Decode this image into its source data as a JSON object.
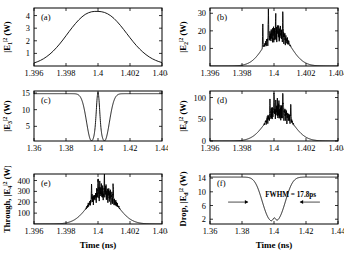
{
  "figure": {
    "xaxis_name": "Time (ns)",
    "panels": [
      "a",
      "b",
      "c",
      "d",
      "e",
      "f"
    ]
  },
  "chart_data": [
    {
      "type": "line",
      "panel": "a",
      "tag": "(a)",
      "title": "",
      "xlabel": "Time (ns)",
      "ylabel": "|E₁|² (W)",
      "ylabel_parts": {
        "pre": "|E",
        "sub": "1",
        "sup": "2",
        "post": " (W)"
      },
      "xlim": [
        1.396,
        1.404
      ],
      "ylim": [
        0,
        4.6
      ],
      "xticks": [
        1.396,
        1.398,
        1.4,
        1.402,
        1.404
      ],
      "xticklabels": [
        "1.396",
        "1.398",
        "1.4",
        "1.402",
        "1.404"
      ],
      "yticks": [
        1,
        2,
        3,
        4
      ],
      "yticklabels": [
        "1",
        "2",
        "3",
        "4"
      ],
      "grid": false,
      "legend": "none",
      "noise": 0,
      "shape": "gaussian-pulse",
      "x": [
        1.396,
        1.3962,
        1.3964,
        1.3966,
        1.3968,
        1.397,
        1.3972,
        1.3974,
        1.3976,
        1.3978,
        1.398,
        1.3982,
        1.3984,
        1.3986,
        1.3988,
        1.399,
        1.3992,
        1.3994,
        1.3996,
        1.3998,
        1.4,
        1.4002,
        1.4004,
        1.4006,
        1.4008,
        1.401,
        1.4012,
        1.4014,
        1.4016,
        1.4018,
        1.402,
        1.4022,
        1.4024,
        1.4026,
        1.4028,
        1.403,
        1.4032,
        1.4034,
        1.4036,
        1.4038,
        1.404
      ],
      "y": [
        0.24,
        0.33,
        0.44,
        0.58,
        0.75,
        0.95,
        1.18,
        1.45,
        1.74,
        2.06,
        2.4,
        2.74,
        3.07,
        3.38,
        3.66,
        3.9,
        4.09,
        4.22,
        4.3,
        4.33,
        4.33,
        4.31,
        4.25,
        4.14,
        3.98,
        3.77,
        3.51,
        3.22,
        2.9,
        2.57,
        2.24,
        1.92,
        1.62,
        1.35,
        1.11,
        0.9,
        0.72,
        0.57,
        0.45,
        0.35,
        0.27
      ]
    },
    {
      "type": "line",
      "panel": "b",
      "tag": "(b)",
      "title": "",
      "xlabel": "Time (ns)",
      "ylabel": "|E₂|² (W)",
      "ylabel_parts": {
        "pre": "|E",
        "sub": "2",
        "sup": "2",
        "post": " (W)"
      },
      "xlim": [
        1.396,
        1.404
      ],
      "ylim": [
        0,
        33
      ],
      "xticks": [
        1.396,
        1.398,
        1.4,
        1.402,
        1.404
      ],
      "xticklabels": [
        "1.396",
        "1.398",
        "1.4",
        "1.402",
        "1.404"
      ],
      "yticks": [
        10,
        20,
        30
      ],
      "yticklabels": [
        "10",
        "20",
        "30"
      ],
      "grid": false,
      "legend": "none",
      "shape": "chaotic-envelope",
      "envelope_peak": 19.0,
      "envelope_center": 1.4002,
      "envelope_width": 0.00115,
      "noise_amp": 4.0,
      "noise_onset": 0.55,
      "spikes": [
        {
          "x": 1.39965,
          "y": 31.5
        },
        {
          "x": 1.40055,
          "y": 30.5
        },
        {
          "x": 1.4001,
          "y": 25.0
        },
        {
          "x": 1.3993,
          "y": 24.0
        }
      ],
      "seed": 17
    },
    {
      "type": "line",
      "panel": "c",
      "tag": "(c)",
      "title": "",
      "xlabel": "Time (ns)",
      "ylabel": "|E₃|² (W)",
      "ylabel_parts": {
        "pre": "|E",
        "sub": "3",
        "sup": "2",
        "post": " (W)"
      },
      "xlim": [
        1.36,
        1.44
      ],
      "ylim": [
        0.6,
        15.6
      ],
      "xticks": [
        1.36,
        1.38,
        1.4,
        1.42,
        1.44
      ],
      "xticklabels": [
        "1.36",
        "1.38",
        "1.4",
        "1.42",
        "1.44"
      ],
      "yticks": [
        5,
        10,
        15
      ],
      "yticklabels": [
        "5",
        "10",
        "15"
      ],
      "grid": false,
      "legend": "none",
      "shape": "double-dip-with-central-spike",
      "baseline": 14.8,
      "dips": [
        {
          "center": 1.3958,
          "depth": 13.9,
          "width": 0.0042
        },
        {
          "center": 1.4042,
          "depth": 13.9,
          "width": 0.0042
        }
      ],
      "central_spike": {
        "center": 1.4,
        "height": 15.2,
        "width": 0.0013
      }
    },
    {
      "type": "line",
      "panel": "d",
      "tag": "(d)",
      "title": "",
      "xlabel": "Time (ns)",
      "ylabel": "|E₄|² (W)",
      "ylabel_parts": {
        "pre": "|E",
        "sub": "4",
        "sup": "2",
        "post": " (W)"
      },
      "xlim": [
        1.396,
        1.404
      ],
      "ylim": [
        0,
        115
      ],
      "xticks": [
        1.396,
        1.398,
        1.4,
        1.402,
        1.404
      ],
      "xticklabels": [
        "1.396",
        "1.398",
        "1.4",
        "1.402",
        "1.404"
      ],
      "yticks": [
        0,
        50,
        100
      ],
      "yticklabels": [
        "0",
        "50",
        "100"
      ],
      "grid": false,
      "legend": "none",
      "shape": "chaotic-envelope",
      "envelope_peak": 70.0,
      "envelope_center": 1.4003,
      "envelope_width": 0.00118,
      "noise_amp": 15.0,
      "noise_onset": 0.5,
      "spikes": [
        {
          "x": 1.4,
          "y": 112.0
        },
        {
          "x": 1.40055,
          "y": 97.0
        },
        {
          "x": 1.39975,
          "y": 92.0
        },
        {
          "x": 1.40105,
          "y": 88.0
        }
      ],
      "seed": 29
    },
    {
      "type": "line",
      "panel": "e",
      "tag": "(e)",
      "title": "",
      "xlabel": "Time (ns)",
      "ylabel": "Through, |E₄|² (W)",
      "ylabel_parts": {
        "pre": "Through, |E",
        "sub": "4",
        "sup": "2",
        "post": " (W)"
      },
      "xlim": [
        1.396,
        1.404
      ],
      "ylim": [
        0,
        460
      ],
      "xticks": [
        1.396,
        1.398,
        1.4,
        1.402,
        1.404
      ],
      "xticklabels": [
        "1.396",
        "1.398",
        "1.4",
        "1.402",
        "1.404"
      ],
      "yticks": [
        100,
        200,
        300,
        400
      ],
      "yticklabels": [
        "100",
        "200",
        "300",
        "400"
      ],
      "grid": false,
      "legend": "none",
      "shape": "chaotic-envelope",
      "envelope_peak": 290.0,
      "envelope_center": 1.4003,
      "envelope_width": 0.00125,
      "noise_amp": 60.0,
      "noise_onset": 0.45,
      "spikes": [
        {
          "x": 1.4,
          "y": 452.0
        },
        {
          "x": 1.4004,
          "y": 415.0
        },
        {
          "x": 1.3996,
          "y": 372.0
        },
        {
          "x": 1.40095,
          "y": 360.0
        }
      ],
      "seed": 41
    },
    {
      "type": "line",
      "panel": "f",
      "tag": "(f)",
      "title": "",
      "xlabel": "Time (ns)",
      "ylabel": "Drop, |Eₑ|² (W)",
      "ylabel_parts": {
        "pre": "Drop, |E",
        "sub": "d",
        "sup": "2",
        "post": " (W)"
      },
      "xlim": [
        1.36,
        1.44
      ],
      "ylim": [
        0.6,
        15.2
      ],
      "xticks": [
        1.36,
        1.38,
        1.4,
        1.42,
        1.44
      ],
      "xticklabels": [
        "1.36",
        "1.38",
        "1.4",
        "1.42",
        "1.44"
      ],
      "yticks": [
        2,
        6,
        10,
        14
      ],
      "yticklabels": [
        "2",
        "6",
        "10",
        "14"
      ],
      "grid": false,
      "legend": "none",
      "shape": "single-deep-dip-with-bump",
      "baseline": 14.3,
      "dip": {
        "center": 1.3999,
        "depth": 13.0,
        "width": 0.0088
      },
      "bottom_bump": {
        "center": 1.4002,
        "height": 1.1,
        "width": 0.0012
      },
      "annotation": {
        "text": "FWHM = 17.8ps",
        "value": 17.8,
        "unit": "ps",
        "arrow_left_x": 1.3838,
        "arrow_right_x": 1.4162,
        "arrow_y": 7.0
      }
    }
  ]
}
